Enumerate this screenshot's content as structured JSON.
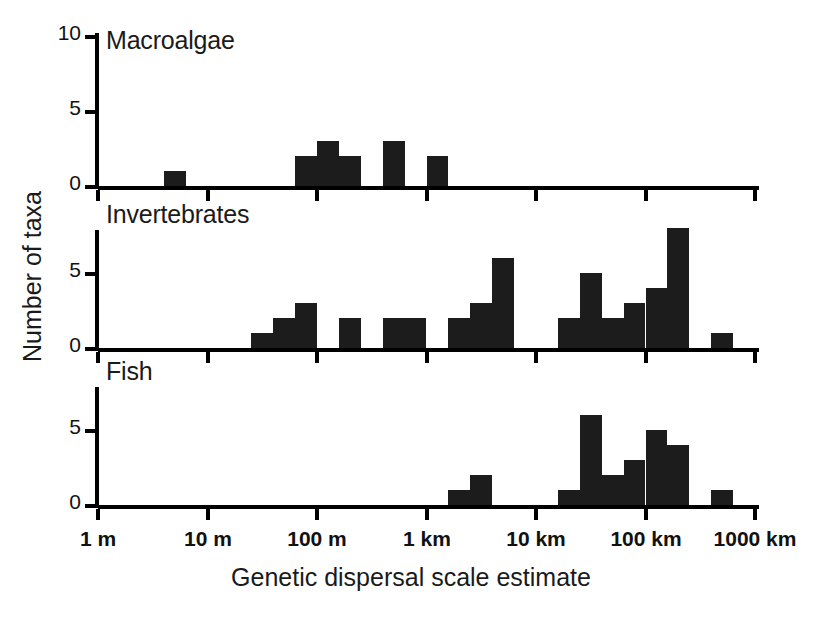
{
  "chart_data": {
    "type": "bar",
    "title": "",
    "xlabel": "Genetic dispersal scale estimate",
    "ylabel": "Number of taxa",
    "xscale": "log",
    "xlim": [
      1,
      1000000
    ],
    "x_unit_note": "metres; tick labels shown as 1 m to 1000 km",
    "x_tick_labels": [
      "1 m",
      "10 m",
      "100 m",
      "1 km",
      "10 km",
      "100 km",
      "1000 km"
    ],
    "x_tick_values": [
      1,
      10,
      100,
      1000,
      10000,
      100000,
      1000000
    ],
    "bins_per_decade": 5,
    "ylim": [
      0,
      10
    ],
    "y_ticks": [
      0,
      5,
      10
    ],
    "grid": false,
    "legend": false,
    "panels": [
      {
        "name": "Macroalgae",
        "label": "Macroalgae",
        "y_tick_labels": [
          "0",
          "5",
          "10"
        ],
        "y_ticks": [
          0,
          5,
          10
        ],
        "bins": [
          {
            "index": 0,
            "left_m": 1.0,
            "value": 0
          },
          {
            "index": 1,
            "left_m": 2.51,
            "value": 0
          },
          {
            "index": 2,
            "left_m": 6.31,
            "value": 0
          },
          {
            "index": 3,
            "left_m": 15.8,
            "value": 1
          },
          {
            "index": 4,
            "left_m": 39.8,
            "value": 0
          },
          {
            "index": 5,
            "left_m": 100,
            "value": 0
          },
          {
            "index": 6,
            "left_m": 251,
            "value": 0
          },
          {
            "index": 7,
            "left_m": 631,
            "value": 0
          },
          {
            "index": 8,
            "left_m": 1580,
            "value": 0
          },
          {
            "index": 9,
            "left_m": 3980,
            "value": 2
          },
          {
            "index": 10,
            "left_m": 10000,
            "value": 3
          },
          {
            "index": 11,
            "left_m": 25100,
            "value": 2
          },
          {
            "index": 12,
            "left_m": 63100,
            "value": 0
          },
          {
            "index": 13,
            "left_m": 158000,
            "value": 3
          },
          {
            "index": 14,
            "left_m": 398000,
            "value": 0
          },
          {
            "index": 15,
            "left_m": 1000000,
            "value": 2
          },
          {
            "index": 16,
            "left_m": 2510000,
            "value": 0
          },
          {
            "index": 17,
            "left_m": 6310000,
            "value": 0
          },
          {
            "index": 18,
            "left_m": 15800000,
            "value": 0
          },
          {
            "index": 19,
            "left_m": 39800000,
            "value": 0
          },
          {
            "index": 20,
            "left_m": 100000000,
            "value": 0
          },
          {
            "index": 21,
            "left_m": 251000000,
            "value": 0
          },
          {
            "index": 22,
            "left_m": 631000000,
            "value": 0
          },
          {
            "index": 23,
            "left_m": 1580000000,
            "value": 0
          },
          {
            "index": 24,
            "left_m": 3980000000,
            "value": 0
          },
          {
            "index": 25,
            "left_m": 10000000000.0,
            "value": 0
          },
          {
            "index": 26,
            "left_m": 25100000000.0,
            "value": 0
          },
          {
            "index": 27,
            "left_m": 63100000000.0,
            "value": 0
          },
          {
            "index": 28,
            "left_m": 158000000000.0,
            "value": 0
          },
          {
            "index": 29,
            "left_m": 398000000000.0,
            "value": 0
          }
        ],
        "values": [
          0,
          0,
          0,
          1,
          0,
          0,
          0,
          0,
          0,
          2,
          3,
          2,
          0,
          3,
          0,
          2,
          0,
          0,
          0,
          0,
          0,
          0,
          0,
          0,
          0,
          0,
          0,
          0,
          0,
          0
        ],
        "total_taxa": 13
      },
      {
        "name": "Invertebrates",
        "label": "Invertebrates",
        "y_tick_labels": [
          "0",
          "5"
        ],
        "y_ticks": [
          0,
          5
        ],
        "values": [
          0,
          0,
          0,
          0,
          0,
          0,
          0,
          1,
          2,
          3,
          0,
          2,
          0,
          2,
          2,
          0,
          2,
          3,
          6,
          0,
          0,
          2,
          5,
          2,
          3,
          4,
          8,
          0,
          1,
          0
        ],
        "bins": [
          {
            "index": 7,
            "left_m": 631,
            "value": 1
          },
          {
            "index": 8,
            "left_m": 1580,
            "value": 2
          },
          {
            "index": 9,
            "left_m": 3980,
            "value": 3
          },
          {
            "index": 11,
            "left_m": 25100,
            "value": 2
          },
          {
            "index": 13,
            "left_m": 158000,
            "value": 2
          },
          {
            "index": 14,
            "left_m": 398000,
            "value": 2
          },
          {
            "index": 16,
            "left_m": 2510000,
            "value": 2
          },
          {
            "index": 17,
            "left_m": 6310000,
            "value": 3
          },
          {
            "index": 18,
            "left_m": 15800000,
            "value": 6
          },
          {
            "index": 21,
            "left_m": 251000000,
            "value": 2
          },
          {
            "index": 22,
            "left_m": 631000000,
            "value": 5
          },
          {
            "index": 23,
            "left_m": 1580000000,
            "value": 2
          },
          {
            "index": 24,
            "left_m": 3980000000,
            "value": 3
          },
          {
            "index": 25,
            "left_m": 10000000000.0,
            "value": 4
          },
          {
            "index": 26,
            "left_m": 25100000000.0,
            "value": 8
          },
          {
            "index": 28,
            "left_m": 158000000000.0,
            "value": 1
          }
        ],
        "total_taxa": 46
      },
      {
        "name": "Fish",
        "label": "Fish",
        "y_tick_labels": [
          "0",
          "5"
        ],
        "y_ticks": [
          0,
          5
        ],
        "values": [
          0,
          0,
          0,
          0,
          0,
          0,
          0,
          0,
          0,
          0,
          0,
          0,
          0,
          0,
          0,
          0,
          1,
          2,
          0,
          0,
          0,
          1,
          6,
          2,
          3,
          5,
          4,
          0,
          1,
          0
        ],
        "bins": [
          {
            "index": 16,
            "left_m": 2510000,
            "value": 1
          },
          {
            "index": 17,
            "left_m": 6310000,
            "value": 2
          },
          {
            "index": 21,
            "left_m": 251000000,
            "value": 1
          },
          {
            "index": 22,
            "left_m": 631000000,
            "value": 6
          },
          {
            "index": 23,
            "left_m": 1580000000,
            "value": 2
          },
          {
            "index": 24,
            "left_m": 3980000000,
            "value": 3
          },
          {
            "index": 25,
            "left_m": 10000000000.0,
            "value": 5
          },
          {
            "index": 26,
            "left_m": 25100000000.0,
            "value": 4
          },
          {
            "index": 28,
            "left_m": 158000000000.0,
            "value": 1
          }
        ],
        "total_taxa": 25
      }
    ]
  },
  "axes": {
    "x_title": "Genetic dispersal scale estimate",
    "y_title": "Number of taxa",
    "x_ticks": [
      {
        "label": "1 m",
        "px": 98
      },
      {
        "label": "10 m",
        "px": 208
      },
      {
        "label": "100 m",
        "px": 317
      },
      {
        "label": "1 km",
        "px": 427
      },
      {
        "label": "10 km",
        "px": 536
      },
      {
        "label": "100 km",
        "px": 646
      },
      {
        "label": "1000 km",
        "px": 755
      }
    ]
  },
  "panel_geometry": {
    "left_px": 98,
    "right_px": 755,
    "bar_width_px": 21.9,
    "unit_px": 15,
    "macroalgae_baseline": 186,
    "invertebrates_baseline": 348,
    "fish_baseline": 505
  }
}
